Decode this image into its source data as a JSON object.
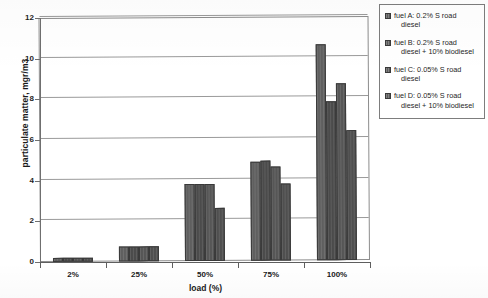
{
  "chart_data": {
    "type": "bar",
    "title": "",
    "xlabel": "load (%)",
    "ylabel": "particulate matter, mgr/m3",
    "categories": [
      "2%",
      "25%",
      "50%",
      "75%",
      "100%"
    ],
    "ylim": [
      0,
      12
    ],
    "yticks": [
      0,
      2,
      4,
      6,
      8,
      10,
      12
    ],
    "grid": true,
    "legend_position": "right-outside",
    "series": [
      {
        "name": "fuel A: 0.2% S road diesel",
        "values": [
          0.2,
          0.75,
          3.8,
          4.85,
          10.6
        ]
      },
      {
        "name": "fuel B: 0.2% S road diesel + 10% biodiesel",
        "values": [
          0.2,
          0.75,
          3.8,
          4.9,
          7.8
        ]
      },
      {
        "name": "fuel C: 0.05% S road diesel",
        "values": [
          0.2,
          0.75,
          3.8,
          4.6,
          8.7
        ]
      },
      {
        "name": "fuel D: 0.05% S road diesel + 10% biodiesel",
        "values": [
          0.2,
          0.72,
          2.6,
          3.8,
          6.4
        ]
      }
    ]
  },
  "legend": {
    "items": [
      {
        "line1": "fuel A: 0.2% S road",
        "line2": "diesel"
      },
      {
        "line1": "fuel B: 0.2% S road",
        "line2": "diesel + 10% biodiesel"
      },
      {
        "line1": "fuel C: 0.05% S road",
        "line2": "diesel"
      },
      {
        "line1": "fuel D: 0.05% S road",
        "line2": "diesel + 10% biodiesel"
      }
    ]
  }
}
